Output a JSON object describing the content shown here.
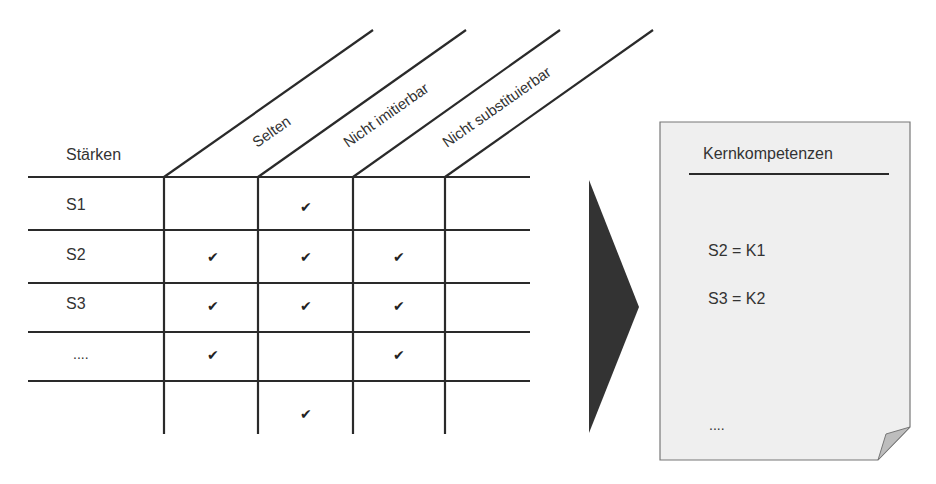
{
  "diagram": {
    "row_header": "Stärken",
    "criteria": [
      "Selten",
      "Nicht imitierbar",
      "Nicht substituierbar"
    ],
    "rows": [
      {
        "label": "S1",
        "checks": [
          false,
          true,
          false
        ]
      },
      {
        "label": "S2",
        "checks": [
          true,
          true,
          true
        ]
      },
      {
        "label": "S3",
        "checks": [
          true,
          true,
          true
        ]
      },
      {
        "label": "....",
        "checks": [
          true,
          false,
          true
        ]
      },
      {
        "label": "",
        "checks": [
          false,
          true,
          false
        ]
      }
    ],
    "check_symbol": "✔",
    "arrow_icon": "right-triangle-arrow",
    "result_document": {
      "title": "Kernkompetenzen",
      "items": [
        "S2 = K1",
        "S3 = K2"
      ],
      "ellipsis": "...."
    },
    "colors": {
      "line": "#2a2a2a",
      "arrow": "#333333",
      "document_fill": "#efefef",
      "document_border": "#777777",
      "fold_fill": "#bdbdbd"
    }
  }
}
